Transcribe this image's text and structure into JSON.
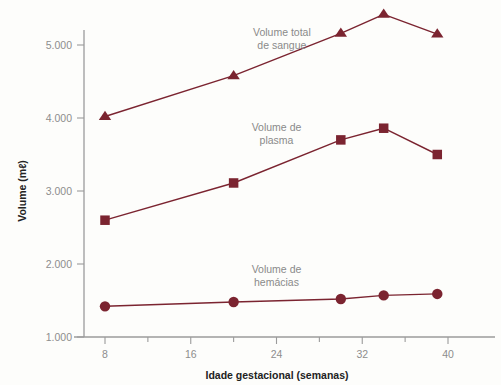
{
  "chart_data": {
    "type": "line",
    "title": "",
    "subtitle": "",
    "xlabel": "Idade gestacional (semanas)",
    "ylabel": "Volume (mℓ)",
    "xlim": [
      4,
      44
    ],
    "ylim": [
      1000,
      5600
    ],
    "xticks": [
      8,
      16,
      24,
      32,
      40
    ],
    "xtick_labels": [
      "8",
      "16",
      "24",
      "32",
      "40"
    ],
    "xminor_ticks": [
      12,
      20,
      28,
      36
    ],
    "yticks": [
      1000,
      2000,
      3000,
      4000,
      5000
    ],
    "ytick_labels": [
      "1.000",
      "2.000",
      "3.000",
      "4.000",
      "5.000"
    ],
    "grid": false,
    "legend_position": "inline-annotations",
    "accent_color": "#7b2430",
    "axis_color": "#9b9b9b",
    "label_color": "#8a8a8a",
    "x": [
      8,
      20,
      30,
      34,
      39
    ],
    "series": [
      {
        "name": "Volume total de sangue",
        "marker": "triangle",
        "color": "#7b2430",
        "label_text_line1": "Volume total",
        "label_text_line2": "de sangue",
        "label_x": 24.5,
        "label_y": 5120,
        "values": [
          4020,
          4580,
          5160,
          5420,
          5150
        ]
      },
      {
        "name": "Volume de plasma",
        "marker": "square",
        "color": "#7b2430",
        "label_text_line1": "Volume de",
        "label_text_line2": "plasma",
        "label_x": 24.0,
        "label_y": 3820,
        "values": [
          2600,
          3110,
          3700,
          3860,
          3500
        ]
      },
      {
        "name": "Volume de hémacias",
        "marker": "circle",
        "color": "#7b2430",
        "label_text_line1": "Volume de",
        "label_text_line2": "hemácias",
        "label_x": 24.0,
        "label_y": 1870,
        "values": [
          1420,
          1480,
          1520,
          1570,
          1590
        ]
      }
    ]
  },
  "axes": {
    "y_title": "Volume (mℓ)",
    "x_title": "Idade gestacional (semanas)",
    "y_tick_0": "1.000",
    "y_tick_1": "2.000",
    "y_tick_2": "3.000",
    "y_tick_3": "4.000",
    "y_tick_4": "5.000",
    "x_tick_0": "8",
    "x_tick_1": "16",
    "x_tick_2": "24",
    "x_tick_3": "32",
    "x_tick_4": "40"
  },
  "annotations": {
    "total_line1": "Volume total",
    "total_line2": "de sangue",
    "plasma_line1": "Volume de",
    "plasma_line2": "plasma",
    "hemacias_line1": "Volume de",
    "hemacias_line2": "hemácias"
  }
}
